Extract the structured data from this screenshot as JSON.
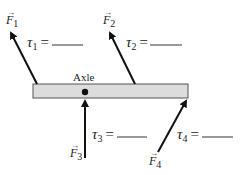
{
  "diagram": {
    "axle_label": "Axle",
    "forces": [
      {
        "symbol": "F",
        "subscript": "1"
      },
      {
        "symbol": "F",
        "subscript": "2"
      },
      {
        "symbol": "F",
        "subscript": "3"
      },
      {
        "symbol": "F",
        "subscript": "4"
      }
    ],
    "torques": [
      {
        "symbol": "τ",
        "subscript": "1",
        "equals": "=",
        "blank": "______"
      },
      {
        "symbol": "τ",
        "subscript": "2",
        "equals": "=",
        "blank": "______"
      },
      {
        "symbol": "τ",
        "subscript": "3",
        "equals": "=",
        "blank": "______"
      },
      {
        "symbol": "τ",
        "subscript": "4",
        "equals": "=",
        "blank": "______"
      }
    ],
    "colors": {
      "beam_fill": "#dcdcdc",
      "beam_stroke": "#555555",
      "arrow": "#111111"
    }
  }
}
